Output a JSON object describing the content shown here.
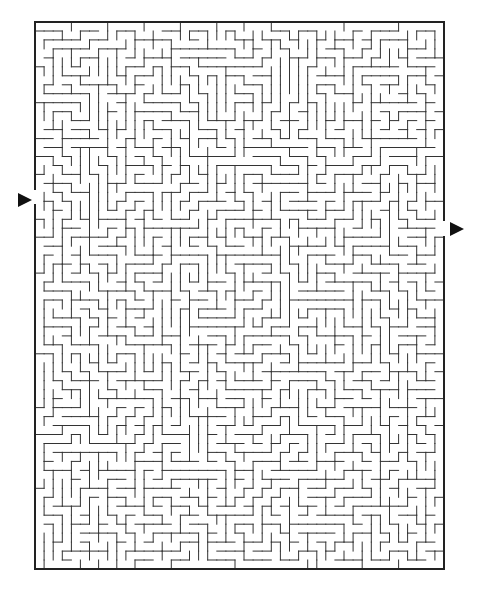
{
  "maze": {
    "left": 35,
    "top": 22,
    "right": 444,
    "bottom": 569,
    "cols": 45,
    "rows": 61,
    "seed": 20231,
    "wall_color": "#333333",
    "border_color": "#222222",
    "entrance": {
      "side": "left",
      "y_from": 190,
      "y_to": 204
    },
    "exit": {
      "side": "right",
      "y_from": 221,
      "y_to": 236
    }
  },
  "arrows": {
    "entrance": {
      "x": 18,
      "y": 193,
      "direction": "right",
      "color": "#111111"
    },
    "exit": {
      "x": 450,
      "y": 222,
      "direction": "right",
      "color": "#111111"
    }
  }
}
